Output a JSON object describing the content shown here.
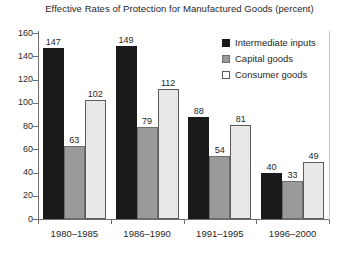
{
  "chart_data": {
    "type": "bar",
    "title": "Effective Rates of Protection for Manufactured Goods (percent)",
    "xlabel": "",
    "ylabel": "",
    "ylim": [
      0,
      160
    ],
    "yticks": [
      0,
      20,
      40,
      60,
      80,
      100,
      120,
      140,
      160
    ],
    "grid": false,
    "legend_position": "top-right",
    "categories": [
      "1980–1985",
      "1986–1990",
      "1991–1995",
      "1996–2000"
    ],
    "series": [
      {
        "name": "Intermediate inputs",
        "color": "#1a1a1a",
        "values": [
          147,
          149,
          88,
          40
        ]
      },
      {
        "name": "Capital goods",
        "color": "#9a9a9a",
        "values": [
          63,
          79,
          54,
          33
        ]
      },
      {
        "name": "Consumer goods",
        "color": "#e9e9e9",
        "values": [
          102,
          112,
          81,
          49
        ]
      }
    ]
  }
}
